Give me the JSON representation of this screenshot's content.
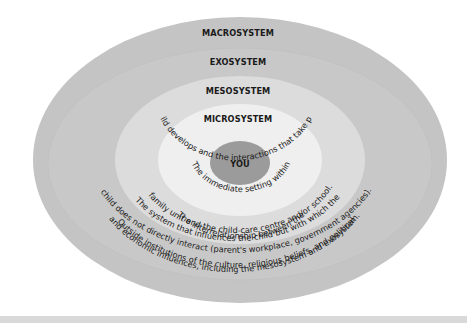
{
  "diagram": {
    "type": "nested-ellipses",
    "colors": {
      "macrosystem": "#c4c4c4",
      "exosystem": "#c9c9c9",
      "mesosystem": "#dcdcdc",
      "microsystem": "#eeeeee",
      "you": "#9a9a9a",
      "background": "#ffffff",
      "footer_rule": "#d9d9d9"
    },
    "layers": [
      {
        "id": "macrosystem",
        "label": "MACROSYSTEM",
        "description_lines": [
          "Outside institutions of the culture, religious beliefs, and political",
          "and economic influences, including the mesosystem and exosystem."
        ]
      },
      {
        "id": "exosystem",
        "label": "EXOSYSTEM",
        "description_lines": [
          "The system that influences the child but with which the",
          "child does not directly interact (parent's workplace, government agencies)."
        ]
      },
      {
        "id": "mesosystem",
        "label": "MESOSYSTEM",
        "description_lines": [
          "The interrelationship between the",
          "family unit and the child-care centre and/or school."
        ]
      },
      {
        "id": "microsystem",
        "label": "MICROSYSTEM",
        "description_lines": [
          "The immediate setting within",
          "which a child develops and the interactions that take place there."
        ]
      },
      {
        "id": "you",
        "label": "YOU"
      }
    ]
  }
}
